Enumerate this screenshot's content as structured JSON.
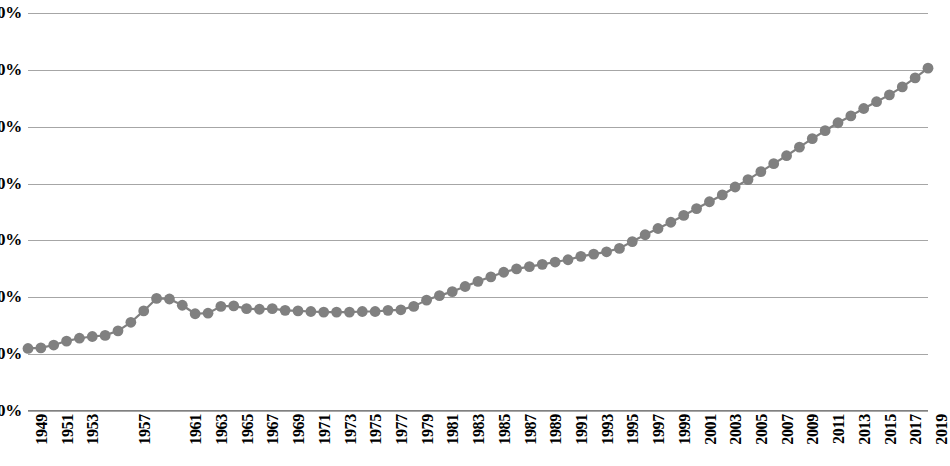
{
  "chart_data": {
    "type": "line",
    "title": "",
    "subtitle": "",
    "xlabel": "",
    "ylabel": "",
    "ylim": [
      0,
      70
    ],
    "y_ticks": [
      0,
      10,
      20,
      30,
      40,
      50,
      60,
      70
    ],
    "y_tick_labels": [
      "0%",
      "10%",
      "20%",
      "30%",
      "40%",
      "50%",
      "60%",
      "70%"
    ],
    "y_unit": "%",
    "grid": true,
    "legend": null,
    "legend_position": "none",
    "marker": "circle",
    "marker_color": "#808080",
    "line_color": "#808080",
    "gridline_color": "#a6a6a6",
    "x": [
      1949,
      1950,
      1951,
      1952,
      1953,
      1954,
      1955,
      1956,
      1957,
      1958,
      1959,
      1960,
      1961,
      1962,
      1963,
      1964,
      1965,
      1966,
      1967,
      1968,
      1969,
      1970,
      1971,
      1972,
      1973,
      1974,
      1975,
      1976,
      1977,
      1978,
      1979,
      1980,
      1981,
      1982,
      1983,
      1984,
      1985,
      1986,
      1987,
      1988,
      1989,
      1990,
      1991,
      1992,
      1993,
      1994,
      1995,
      1996,
      1997,
      1998,
      1999,
      2000,
      2001,
      2002,
      2003,
      2004,
      2005,
      2006,
      2007,
      2008,
      2009,
      2010,
      2011,
      2012,
      2013,
      2014,
      2015,
      2016,
      2017,
      2018,
      2019
    ],
    "x_tick_labels": [
      "1949",
      "1951",
      "1953",
      "1957",
      "1961",
      "1963",
      "1965",
      "1967",
      "1969",
      "1971",
      "1973",
      "1975",
      "1977",
      "1979",
      "1981",
      "1983",
      "1985",
      "1987",
      "1989",
      "1991",
      "1993",
      "1995",
      "1997",
      "1999",
      "2001",
      "2003",
      "2005",
      "2007",
      "2009",
      "2011",
      "2013",
      "2015",
      "2017",
      "2019"
    ],
    "x_tick_years": [
      1949,
      1951,
      1953,
      1957,
      1961,
      1963,
      1965,
      1967,
      1969,
      1971,
      1973,
      1975,
      1977,
      1979,
      1981,
      1983,
      1985,
      1987,
      1989,
      1991,
      1993,
      1995,
      1997,
      1999,
      2001,
      2003,
      2005,
      2007,
      2009,
      2011,
      2013,
      2015,
      2017,
      2019
    ],
    "values": [
      11.0,
      11.1,
      11.6,
      12.3,
      12.8,
      13.1,
      13.3,
      14.1,
      15.6,
      17.6,
      19.8,
      19.7,
      18.6,
      17.1,
      17.2,
      18.4,
      18.5,
      18.0,
      17.9,
      18.0,
      17.7,
      17.6,
      17.5,
      17.4,
      17.4,
      17.4,
      17.5,
      17.5,
      17.7,
      17.8,
      18.4,
      19.5,
      20.3,
      21.0,
      21.9,
      22.8,
      23.6,
      24.4,
      25.0,
      25.4,
      25.8,
      26.2,
      26.6,
      27.2,
      27.6,
      28.0,
      28.6,
      29.8,
      31.0,
      32.1,
      33.2,
      34.4,
      35.6,
      36.8,
      38.0,
      39.4,
      40.7,
      42.1,
      43.5,
      44.9,
      46.4,
      47.9,
      49.3,
      50.7,
      51.9,
      53.2,
      54.4,
      55.6,
      57.0,
      58.6,
      60.3
    ],
    "series": [
      {
        "name": "",
        "values": [
          11.0,
          11.1,
          11.6,
          12.3,
          12.8,
          13.1,
          13.3,
          14.1,
          15.6,
          17.6,
          19.8,
          19.7,
          18.6,
          17.1,
          17.2,
          18.4,
          18.5,
          18.0,
          17.9,
          18.0,
          17.7,
          17.6,
          17.5,
          17.4,
          17.4,
          17.4,
          17.5,
          17.5,
          17.7,
          17.8,
          18.4,
          19.5,
          20.3,
          21.0,
          21.9,
          22.8,
          23.6,
          24.4,
          25.0,
          25.4,
          25.8,
          26.2,
          26.6,
          27.2,
          27.6,
          28.0,
          28.6,
          29.8,
          31.0,
          32.1,
          33.2,
          34.4,
          35.6,
          36.8,
          38.0,
          39.4,
          40.7,
          42.1,
          43.5,
          44.9,
          46.4,
          47.9,
          49.3,
          50.7,
          51.9,
          53.2,
          54.4,
          55.6,
          57.0,
          58.6,
          60.3
        ]
      }
    ]
  }
}
